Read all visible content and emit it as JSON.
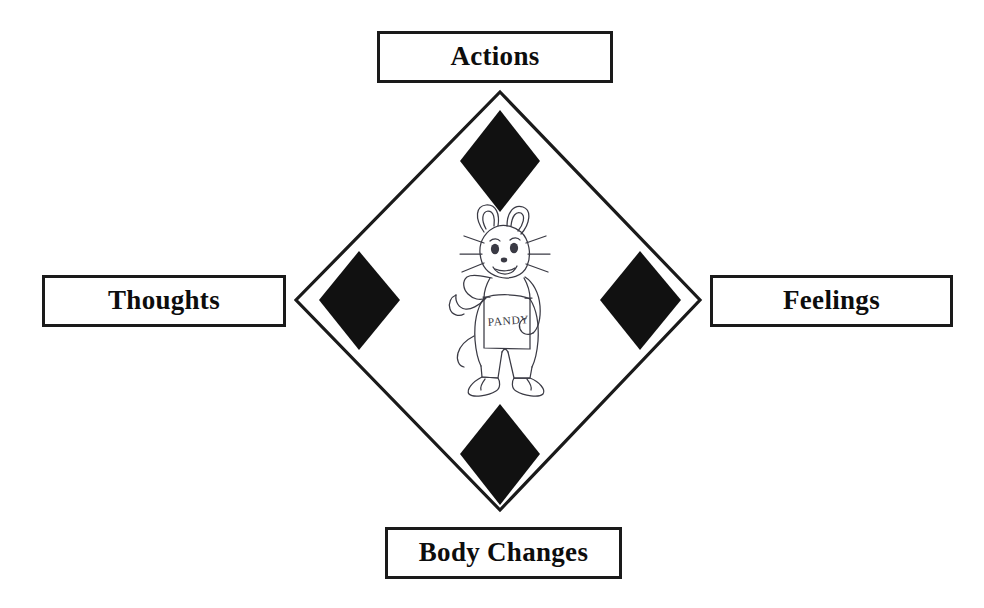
{
  "diagram": {
    "type": "cognitive-behavioural-cycle-diamond",
    "outline_color": "#1a1a1a",
    "fill_color": "#111111",
    "background_color": "#ffffff",
    "nodes": [
      {
        "id": "actions",
        "label": "Actions",
        "position": "top"
      },
      {
        "id": "thoughts",
        "label": "Thoughts",
        "position": "left"
      },
      {
        "id": "feelings",
        "label": "Feelings",
        "position": "right"
      },
      {
        "id": "body_changes",
        "label": "Body Changes",
        "position": "bottom"
      }
    ],
    "markers": [
      {
        "id": "marker-top",
        "shape": "filled-diamond",
        "position": "top"
      },
      {
        "id": "marker-left",
        "shape": "filled-diamond",
        "position": "left"
      },
      {
        "id": "marker-right",
        "shape": "filled-diamond",
        "position": "right"
      },
      {
        "id": "marker-bottom",
        "shape": "filled-diamond",
        "position": "bottom"
      }
    ]
  },
  "character": {
    "name": "mouse-character",
    "description": "hand-drawn cartoon mouse wearing bib overalls, flexing one arm",
    "overalls_text": "PANDY"
  }
}
